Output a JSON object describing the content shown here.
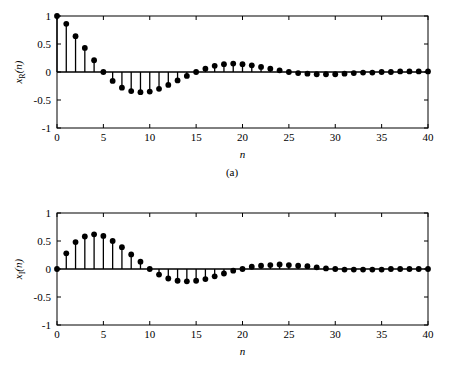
{
  "figure": {
    "panels": [
      {
        "id": "a",
        "caption": "(a)",
        "ylabel_main": "x",
        "ylabel_sub": "R",
        "ylabel_arg": "(n)",
        "xlabel": "n"
      },
      {
        "id": "b",
        "caption": "(b)",
        "ylabel_main": "x",
        "ylabel_sub": "I",
        "ylabel_arg": "(n)",
        "xlabel": "n"
      }
    ],
    "colors": {
      "axis": "#000000",
      "stem": "#000000",
      "marker": "#000000",
      "background": "#ffffff"
    }
  },
  "chart_data": [
    {
      "type": "line",
      "plot_style": "stem",
      "panel": "a",
      "title": "",
      "xlabel": "n",
      "ylabel": "x_R(n)",
      "xlim": [
        0,
        40
      ],
      "ylim": [
        -1,
        1
      ],
      "xticks": [
        0,
        5,
        10,
        15,
        20,
        25,
        30,
        35,
        40
      ],
      "yticks": [
        -1,
        -0.5,
        0,
        0.5,
        1
      ],
      "xtick_labels": [
        "0",
        "5",
        "10",
        "15",
        "20",
        "25",
        "30",
        "35",
        "40"
      ],
      "ytick_labels": [
        "-1",
        "-0.5",
        "0",
        "0.5",
        "1"
      ],
      "grid": false,
      "legend": null,
      "x": [
        0,
        1,
        2,
        3,
        4,
        5,
        6,
        7,
        8,
        9,
        10,
        11,
        12,
        13,
        14,
        15,
        16,
        17,
        18,
        19,
        20,
        21,
        22,
        23,
        24,
        25,
        26,
        27,
        28,
        29,
        30,
        31,
        32,
        33,
        34,
        35,
        36,
        37,
        38,
        39,
        40
      ],
      "values": [
        1.0,
        0.86,
        0.64,
        0.43,
        0.21,
        0.0,
        -0.16,
        -0.28,
        -0.34,
        -0.36,
        -0.35,
        -0.3,
        -0.23,
        -0.15,
        -0.07,
        0.0,
        0.06,
        0.11,
        0.14,
        0.15,
        0.14,
        0.12,
        0.09,
        0.06,
        0.03,
        0.0,
        -0.02,
        -0.03,
        -0.04,
        -0.04,
        -0.04,
        -0.03,
        -0.02,
        -0.01,
        -0.01,
        0.0,
        0.0,
        0.01,
        0.01,
        0.01,
        0.01
      ]
    },
    {
      "type": "line",
      "plot_style": "stem",
      "panel": "b",
      "title": "",
      "xlabel": "n",
      "ylabel": "x_I(n)",
      "xlim": [
        0,
        40
      ],
      "ylim": [
        -1,
        1
      ],
      "xticks": [
        0,
        5,
        10,
        15,
        20,
        25,
        30,
        35,
        40
      ],
      "yticks": [
        -1,
        -0.5,
        0,
        0.5,
        1
      ],
      "xtick_labels": [
        "0",
        "5",
        "10",
        "15",
        "20",
        "25",
        "30",
        "35",
        "40"
      ],
      "ytick_labels": [
        "-1",
        "-0.5",
        "0",
        "0.5",
        "1"
      ],
      "grid": false,
      "legend": null,
      "x": [
        0,
        1,
        2,
        3,
        4,
        5,
        6,
        7,
        8,
        9,
        10,
        11,
        12,
        13,
        14,
        15,
        16,
        17,
        18,
        19,
        20,
        21,
        22,
        23,
        24,
        25,
        26,
        27,
        28,
        29,
        30,
        31,
        32,
        33,
        34,
        35,
        36,
        37,
        38,
        39,
        40
      ],
      "values": [
        0.0,
        0.28,
        0.48,
        0.58,
        0.62,
        0.59,
        0.5,
        0.39,
        0.26,
        0.13,
        0.0,
        -0.1,
        -0.17,
        -0.21,
        -0.22,
        -0.21,
        -0.18,
        -0.13,
        -0.08,
        -0.03,
        0.0,
        0.04,
        0.06,
        0.07,
        0.08,
        0.07,
        0.06,
        0.05,
        0.03,
        0.01,
        0.0,
        -0.01,
        -0.01,
        -0.01,
        -0.01,
        -0.01,
        0.0,
        0.0,
        0.0,
        0.0,
        0.0
      ]
    }
  ]
}
